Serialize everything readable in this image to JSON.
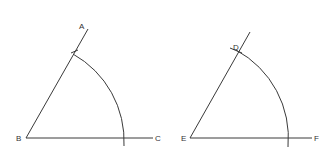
{
  "figures": [
    {
      "id": "left",
      "labels": {
        "vertex": "B",
        "ray_end": "A",
        "base_end": "C"
      },
      "description": "Angle ABC with arc drawn from B, intersecting BA and BC"
    },
    {
      "id": "right",
      "labels": {
        "vertex": "E",
        "arc_point": "D",
        "base_end": "F"
      },
      "description": "Copied angle DEF with arc from E; intersection marks at D"
    }
  ],
  "colors": {
    "stroke": "#3a3a3a",
    "text": "#333333",
    "background": "#ffffff"
  }
}
